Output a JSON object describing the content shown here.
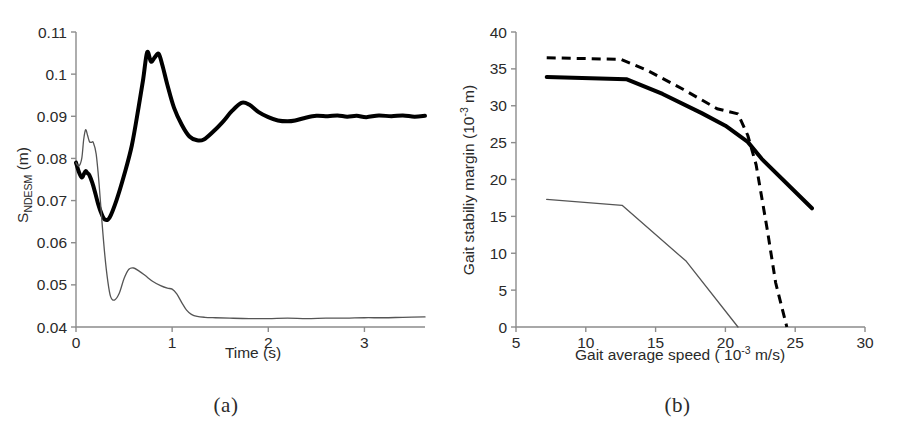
{
  "figure": {
    "background": "#ffffff",
    "panels": [
      "a",
      "b"
    ]
  },
  "panel_a": {
    "caption": "(a)",
    "xlabel": "Time (s)",
    "ylabel_main": "S",
    "ylabel_sub": "NDESM",
    "ylabel_unit": " (m)",
    "ylabel_full": "S_NDESM (m)",
    "xticks": [
      "0",
      "1",
      "2",
      "3"
    ],
    "yticks": [
      "0.04",
      "0.05",
      "0.06",
      "0.07",
      "0.08",
      "0.09",
      "0.1",
      "0.11"
    ]
  },
  "panel_b": {
    "caption": "(b)",
    "xlabel_pre": "Gait average speed ( 10",
    "xlabel_exp": "-3",
    "xlabel_post": " m/s)",
    "xlabel_full": "Gait average speed ( 10^-3 m/s)",
    "ylabel_pre": "Gait stabiliy margin (10",
    "ylabel_exp": "-3",
    "ylabel_post": " m)",
    "ylabel_full": "Gait stabiliy margin (10^-3 m)",
    "xticks": [
      "5",
      "10",
      "15",
      "20",
      "25",
      "30"
    ],
    "yticks": [
      "0",
      "5",
      "10",
      "15",
      "20",
      "25",
      "30",
      "35",
      "40"
    ]
  },
  "chart_data": [
    {
      "type": "line",
      "panel": "a",
      "title": "",
      "xlabel": "Time (s)",
      "ylabel": "S_NDESM (m)",
      "xlim": [
        0,
        3.63
      ],
      "ylim": [
        0.04,
        0.11
      ],
      "grid": false,
      "legend": "none",
      "xticks": [
        0,
        1,
        2,
        3
      ],
      "yticks": [
        0.04,
        0.05,
        0.06,
        0.07,
        0.08,
        0.09,
        0.1,
        0.11
      ],
      "series": [
        {
          "name": "thick-curve",
          "style": "solid-thick",
          "color": "#000000",
          "x": [
            0.0,
            0.03,
            0.06,
            0.08,
            0.1,
            0.12,
            0.14,
            0.17,
            0.2,
            0.23,
            0.26,
            0.3,
            0.35,
            0.42,
            0.5,
            0.58,
            0.65,
            0.7,
            0.74,
            0.78,
            0.82,
            0.86,
            0.9,
            0.95,
            1.02,
            1.1,
            1.18,
            1.26,
            1.33,
            1.42,
            1.52,
            1.62,
            1.72,
            1.8,
            1.9,
            2.0,
            2.1,
            2.2,
            2.28,
            2.38,
            2.5,
            2.62,
            2.72,
            2.82,
            2.92,
            3.02,
            3.15,
            3.28,
            3.4,
            3.52,
            3.63
          ],
          "y": [
            0.079,
            0.0768,
            0.0755,
            0.0762,
            0.077,
            0.0765,
            0.076,
            0.0742,
            0.0718,
            0.0692,
            0.0672,
            0.0655,
            0.066,
            0.07,
            0.076,
            0.083,
            0.092,
            0.099,
            0.1052,
            0.103,
            0.104,
            0.1048,
            0.102,
            0.0975,
            0.092,
            0.088,
            0.0852,
            0.0843,
            0.0845,
            0.0862,
            0.0885,
            0.0912,
            0.0932,
            0.0928,
            0.091,
            0.0898,
            0.089,
            0.0888,
            0.089,
            0.0896,
            0.0901,
            0.09,
            0.0902,
            0.0899,
            0.0901,
            0.0898,
            0.0902,
            0.09,
            0.0902,
            0.0899,
            0.0901
          ]
        },
        {
          "name": "thin-curve",
          "style": "solid-thin",
          "color": "#555555",
          "x": [
            0.0,
            0.03,
            0.06,
            0.08,
            0.1,
            0.12,
            0.14,
            0.16,
            0.18,
            0.21,
            0.24,
            0.27,
            0.3,
            0.33,
            0.36,
            0.4,
            0.45,
            0.5,
            0.55,
            0.6,
            0.66,
            0.72,
            0.8,
            0.88,
            0.95,
            1.0,
            1.05,
            1.1,
            1.15,
            1.2,
            1.26,
            1.34,
            1.45,
            1.6,
            1.8,
            2.0,
            2.2,
            2.4,
            2.6,
            2.8,
            3.0,
            3.2,
            3.4,
            3.63
          ],
          "y": [
            0.079,
            0.0782,
            0.08,
            0.0845,
            0.0868,
            0.0855,
            0.084,
            0.0838,
            0.0838,
            0.081,
            0.074,
            0.065,
            0.057,
            0.051,
            0.0472,
            0.0464,
            0.048,
            0.0515,
            0.0537,
            0.054,
            0.0532,
            0.0522,
            0.0508,
            0.0498,
            0.0492,
            0.049,
            0.0478,
            0.0458,
            0.044,
            0.043,
            0.0425,
            0.0423,
            0.0422,
            0.0421,
            0.042,
            0.042,
            0.0421,
            0.042,
            0.0421,
            0.0421,
            0.0422,
            0.0422,
            0.0423,
            0.0424
          ]
        }
      ]
    },
    {
      "type": "line",
      "panel": "b",
      "title": "",
      "xlabel": "Gait average speed ( 10^-3 m/s)",
      "ylabel": "Gait stabiliy margin (10^-3 m)",
      "xlim": [
        5,
        30
      ],
      "ylim": [
        0,
        40
      ],
      "grid": false,
      "legend": "none",
      "xticks": [
        5,
        10,
        15,
        20,
        25,
        30
      ],
      "yticks": [
        0,
        5,
        10,
        15,
        20,
        25,
        30,
        35,
        40
      ],
      "series": [
        {
          "name": "thick-solid",
          "style": "solid-thick",
          "color": "#000000",
          "x": [
            7.2,
            12.9,
            15.5,
            18.3,
            20.0,
            21.6,
            22.6,
            26.2
          ],
          "y": [
            33.9,
            33.6,
            31.6,
            29.0,
            27.3,
            25.1,
            22.8,
            16.1
          ]
        },
        {
          "name": "dashed",
          "style": "dashed",
          "color": "#000000",
          "x": [
            7.2,
            12.5,
            14.4,
            17.0,
            19.4,
            20.9,
            21.6,
            22.2,
            23.0,
            23.6,
            24.4
          ],
          "y": [
            36.5,
            36.3,
            34.8,
            32.2,
            29.6,
            28.9,
            26.0,
            22.0,
            13.2,
            6.0,
            0.0
          ]
        },
        {
          "name": "thin-solid",
          "style": "solid-thin",
          "color": "#555555",
          "x": [
            7.2,
            12.6,
            17.2,
            20.9
          ],
          "y": [
            17.3,
            16.5,
            8.9,
            0.0
          ]
        }
      ]
    }
  ]
}
